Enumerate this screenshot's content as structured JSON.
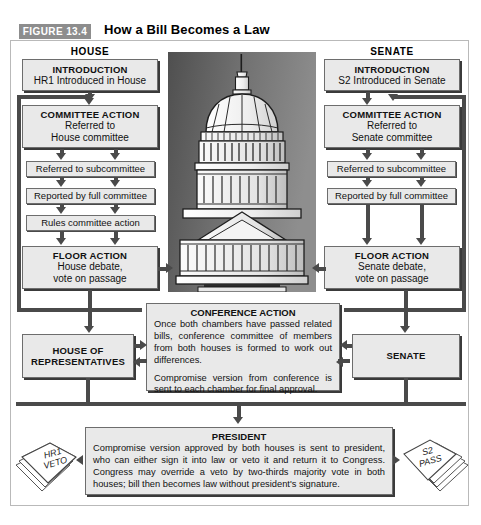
{
  "header": {
    "figure_badge": "FIGURE 13.4",
    "title": "How a Bill Becomes a Law",
    "badge_color": "#8d8d8d"
  },
  "columns": {
    "house_label": "HOUSE",
    "senate_label": "SENATE"
  },
  "house": {
    "introduction": {
      "title": "INTRODUCTION",
      "body": "HR1 Introduced in House"
    },
    "committee_action": {
      "title": "COMMITTEE ACTION",
      "line1": "Referred to",
      "line2": "House committee"
    },
    "subcommittee": "Referred to subcommittee",
    "full_committee": "Reported by full committee",
    "rules_committee": "Rules committee action",
    "floor_action": {
      "title": "FLOOR ACTION",
      "line1": "House debate,",
      "line2": "vote on passage"
    },
    "chamber": {
      "line1": "HOUSE OF",
      "line2": "REPRESENTATIVES"
    }
  },
  "senate": {
    "introduction": {
      "title": "INTRODUCTION",
      "body": "S2 Introduced in Senate"
    },
    "committee_action": {
      "title": "COMMITTEE ACTION",
      "line1": "Referred to",
      "line2": "Senate committee"
    },
    "subcommittee": "Referred to subcommittee",
    "full_committee": "Reported by full committee",
    "floor_action": {
      "title": "FLOOR ACTION",
      "line1": "Senate debate,",
      "line2": "vote on passage"
    },
    "chamber": {
      "line1": "SENATE"
    }
  },
  "conference": {
    "title": "CONFERENCE ACTION",
    "paragraph1": "Once both chambers have passed related bills, conference committee of members from both houses is formed to work out differences.",
    "paragraph2": "Compromise version from conference is sent to each chamber for final approval."
  },
  "president": {
    "title": "PRESIDENT",
    "paragraph1": "Compromise version approved by both houses is sent to president, who can either sign it into law or veto it and return it to Congress. Congress may override a veto by two-thirds majority vote in both houses; bill then becomes law without president's signature."
  },
  "documents": {
    "left": {
      "line1": "HR1",
      "line2": "VETO"
    },
    "right": {
      "line1": "S2",
      "line2": "PASS"
    }
  },
  "illustration": {
    "name": "us-capitol-building"
  }
}
